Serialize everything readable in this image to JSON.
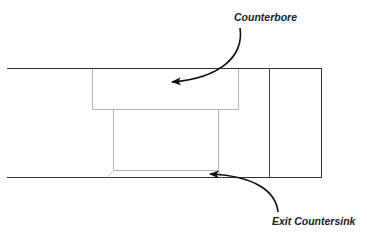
{
  "diagram": {
    "labels": {
      "counterbore": "Counterbore",
      "exit_countersink": "Exit Countersink"
    },
    "colors": {
      "outline": "#333333",
      "hole_outline": "#b5b5b5",
      "arrow": "#111111",
      "background": "#ffffff"
    }
  }
}
